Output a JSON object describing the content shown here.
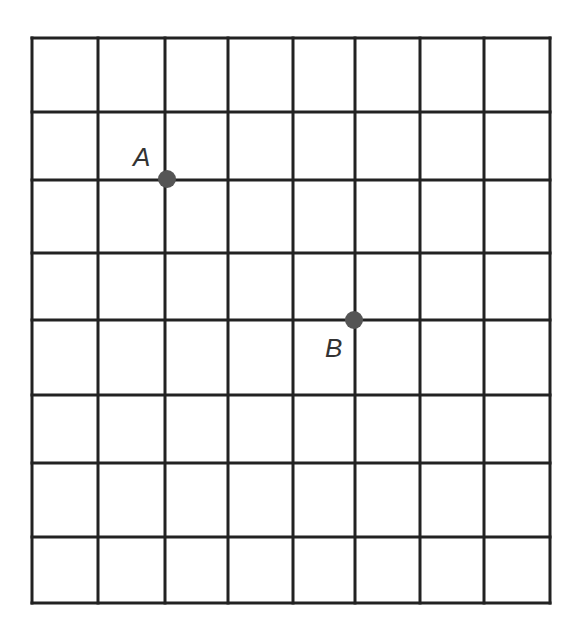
{
  "grid": {
    "columns": 8,
    "rows": 8,
    "x_lines": [
      32,
      98,
      165,
      228,
      293,
      355,
      420,
      484,
      550
    ],
    "y_lines": [
      38,
      112,
      180,
      253,
      320,
      395,
      463,
      537,
      603
    ],
    "line_color": "#222222"
  },
  "points": [
    {
      "label": "A",
      "x": 167,
      "y": 179,
      "label_x": 133,
      "label_y": 142,
      "color": "#555555"
    },
    {
      "label": "B",
      "x": 354,
      "y": 320,
      "label_x": 325,
      "label_y": 333,
      "color": "#555555"
    }
  ]
}
